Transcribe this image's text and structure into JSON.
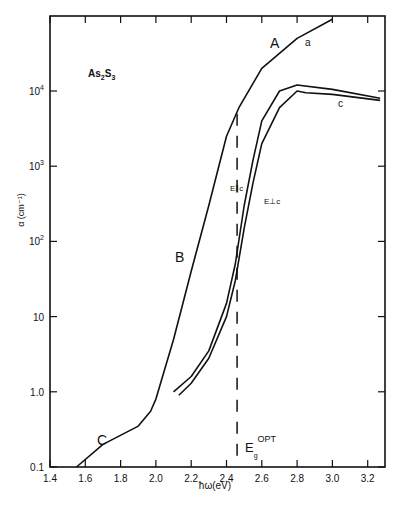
{
  "chart_data": {
    "type": "line",
    "title": "As2S3",
    "xlabel": "ħω (eV)",
    "ylabel": "α (cm⁻¹)",
    "yscale": "log",
    "xlim": [
      1.4,
      3.35
    ],
    "ylim": [
      0.1,
      100000
    ],
    "x_ticks": [
      "1.4",
      "1.6",
      "1.8",
      "2.0",
      "2.2",
      "2.4",
      "2.6",
      "2.8",
      "3.0",
      "3.2"
    ],
    "y_ticks": [
      "0.1",
      "1.0",
      "10",
      "10²",
      "10³",
      "10⁴"
    ],
    "grid": false,
    "annotations": [
      "A",
      "B",
      "C",
      "a",
      "c",
      "E∥c",
      "E⊥c",
      "Eg OPT"
    ],
    "series": [
      {
        "name": "a (amorphous)",
        "x": [
          1.55,
          1.7,
          1.9,
          1.97,
          2.0,
          2.1,
          2.2,
          2.3,
          2.4,
          2.47,
          2.6,
          2.8,
          3.0
        ],
        "y": [
          0.1,
          0.2,
          0.35,
          0.55,
          0.8,
          5,
          40,
          300,
          2500,
          6000,
          20000,
          50000,
          90000
        ]
      },
      {
        "name": "E∥c (crystal)",
        "x": [
          2.1,
          2.2,
          2.3,
          2.4,
          2.45,
          2.5,
          2.55,
          2.6,
          2.7,
          2.8,
          3.0,
          3.27
        ],
        "y": [
          1.0,
          1.6,
          3.5,
          15,
          50,
          300,
          1200,
          4000,
          10000,
          12000,
          10500,
          8000
        ]
      },
      {
        "name": "E⊥c (crystal)",
        "x": [
          2.13,
          2.2,
          2.3,
          2.4,
          2.45,
          2.5,
          2.55,
          2.6,
          2.7,
          2.8,
          2.85,
          3.0,
          3.27
        ],
        "y": [
          0.9,
          1.3,
          2.8,
          10,
          30,
          150,
          600,
          2000,
          6000,
          10000,
          9500,
          9000,
          7500
        ]
      }
    ],
    "dashed_line": {
      "label": "Eg OPT",
      "x": 2.46
    }
  },
  "labels": {
    "title": "As",
    "title_sub1": "2",
    "title_mid": "S",
    "title_sub2": "3",
    "A": "A",
    "B": "B",
    "C": "C",
    "a": "a",
    "c": "c",
    "epar": "E∥c",
    "eperp": "E⊥c",
    "eg": "E",
    "eg_sub": "g",
    "eg_sup": "OPT",
    "xlabel": "ħω(eV)",
    "ylabel": "α (cm⁻¹)"
  }
}
